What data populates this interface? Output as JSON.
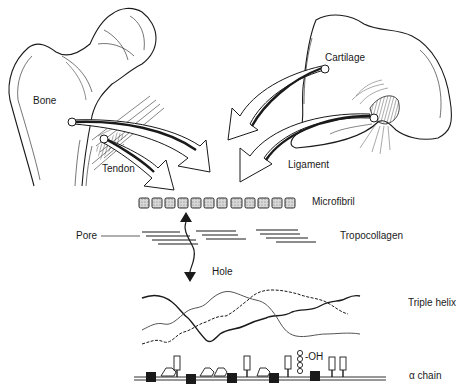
{
  "diagram": {
    "tissues": [
      {
        "id": "bone",
        "label": "Bone"
      },
      {
        "id": "tendon",
        "label": "Tendon"
      },
      {
        "id": "cartilage",
        "label": "Cartilage"
      },
      {
        "id": "ligament",
        "label": "Ligament"
      }
    ],
    "levels": [
      {
        "id": "microfibril",
        "label": "Microfibril"
      },
      {
        "id": "tropocollagen",
        "label": "Tropocollagen"
      },
      {
        "id": "triple_helix",
        "label": "Triple helix"
      },
      {
        "id": "alpha_chain",
        "label": "α chain"
      }
    ],
    "annotations": {
      "pore": "Pore",
      "hole": "Hole",
      "hydroxyl": "-OH"
    },
    "microfibril_units": 12,
    "colors": {
      "ink": "#1a1a1a",
      "fill_gray": "#bdbdbd",
      "background": "#ffffff"
    }
  }
}
